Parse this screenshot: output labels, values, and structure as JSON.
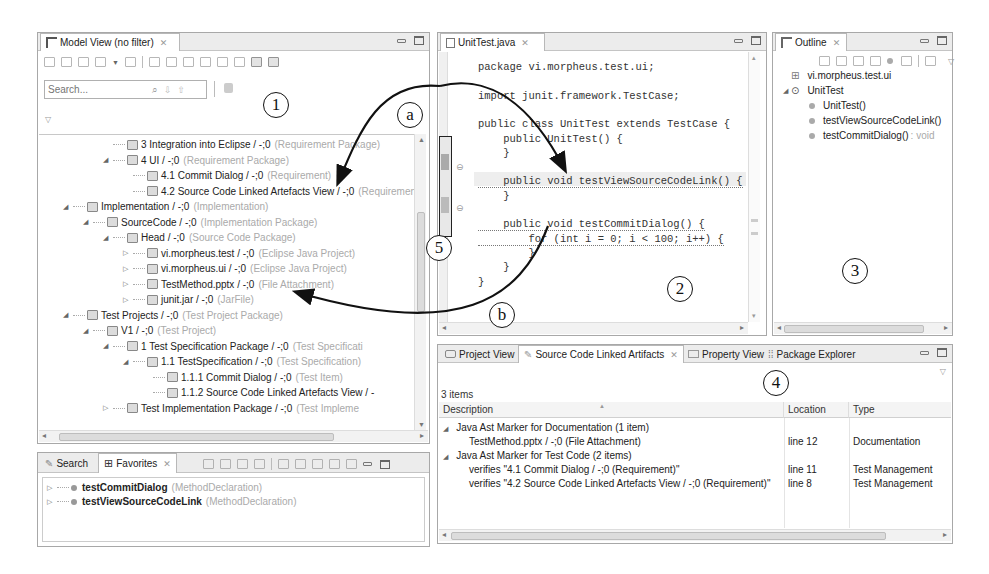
{
  "callouts": {
    "one": "1",
    "two": "2",
    "three": "3",
    "four": "4",
    "five": "5",
    "a": "a",
    "b": "b"
  },
  "model_view": {
    "tab_label": "Model View (no filter)",
    "search_placeholder": "Search...",
    "tree": [
      {
        "label": "3 Integration into Eclipse / -;0",
        "meta": "(Requirement Package)",
        "depth": 3,
        "twisty": "none"
      },
      {
        "label": "4 UI / -;0",
        "meta": "(Requirement Package)",
        "depth": 3,
        "twisty": "open"
      },
      {
        "label": "4.1 Commit Dialog / -;0",
        "meta": "(Requirement)",
        "depth": 4,
        "twisty": "none"
      },
      {
        "label": "4.2 Source Code Linked Artefacts View / -;0",
        "meta": "(Requirement)",
        "depth": 4,
        "twisty": "none"
      },
      {
        "label": "Implementation / -;0",
        "meta": "(Implementation)",
        "depth": 1,
        "twisty": "open"
      },
      {
        "label": "SourceCode / -;0",
        "meta": "(Implementation Package)",
        "depth": 2,
        "twisty": "open"
      },
      {
        "label": "Head / -;0",
        "meta": "(Source Code Package)",
        "depth": 3,
        "twisty": "open"
      },
      {
        "label": "vi.morpheus.test / -;0",
        "meta": "(Eclipse Java Project)",
        "depth": 4,
        "twisty": "closed"
      },
      {
        "label": "vi.morpheus.ui / -;0",
        "meta": "(Eclipse Java Project)",
        "depth": 4,
        "twisty": "closed"
      },
      {
        "label": "TestMethod.pptx / -;0",
        "meta": "(File Attachment)",
        "depth": 4,
        "twisty": "closed"
      },
      {
        "label": "junit.jar / -;0",
        "meta": "(JarFile)",
        "depth": 4,
        "twisty": "closed"
      },
      {
        "label": "Test Projects / -;0",
        "meta": "(Test Project Package)",
        "depth": 1,
        "twisty": "open"
      },
      {
        "label": "V1 / -;0",
        "meta": "(Test Project)",
        "depth": 2,
        "twisty": "open"
      },
      {
        "label": "1 Test Specification Package / -;0",
        "meta": "(Test Specificati",
        "depth": 3,
        "twisty": "open"
      },
      {
        "label": "1.1 TestSpecification / -;0",
        "meta": "(Test Specification)",
        "depth": 4,
        "twisty": "open"
      },
      {
        "label": "1.1.1 Commit Dialog / -;0",
        "meta": "(Test Item)",
        "depth": 5,
        "twisty": "none"
      },
      {
        "label": "1.1.2 Source Code Linked Artefacts View / -",
        "meta": "",
        "depth": 5,
        "twisty": "none"
      },
      {
        "label": "Test Implementation Package / -;0",
        "meta": "(Test Impleme",
        "depth": 3,
        "twisty": "closed"
      }
    ]
  },
  "favorites": {
    "tabs": [
      {
        "label": "Search"
      },
      {
        "label": "Favorites"
      }
    ],
    "items": [
      {
        "label": "testCommitDialog",
        "meta": "(MethodDeclaration)"
      },
      {
        "label": "testViewSourceCodeLink",
        "meta": "(MethodDeclaration)"
      }
    ]
  },
  "editor": {
    "tab_label": "UnitTest.java",
    "lines": [
      "package vi.morpheus.test.ui;",
      "",
      "import junit.framework.TestCase;",
      "",
      "public class UnitTest extends TestCase {",
      "    public UnitTest() {",
      "    }",
      "",
      "    public void testViewSourceCodeLink() {",
      "    }",
      "",
      "    public void testCommitDialog() {",
      "        for (int i = 0; i < 100; i++) {",
      "        }",
      "    }",
      "}"
    ]
  },
  "outline": {
    "tab_label": "Outline",
    "items": [
      {
        "label": "vi.morpheus.test.ui",
        "meta": "",
        "depth": 0
      },
      {
        "label": "UnitTest",
        "meta": "",
        "depth": 0
      },
      {
        "label": "UnitTest()",
        "meta": "",
        "depth": 1
      },
      {
        "label": "testViewSourceCodeLink()",
        "meta": "",
        "depth": 1
      },
      {
        "label": "testCommitDialog()",
        "meta": ": void",
        "depth": 1
      }
    ]
  },
  "linked": {
    "tabs": [
      {
        "label": "Project View"
      },
      {
        "label": "Source Code Linked Artifacts"
      },
      {
        "label": "Property View"
      },
      {
        "label": "Package Explorer"
      }
    ],
    "count": "3 items",
    "columns": [
      "Description",
      "Location",
      "Type"
    ],
    "groups": [
      {
        "label": "Java Ast Marker for Documentation (1 item)",
        "rows": [
          {
            "description": "TestMethod.pptx / -;0 (File Attachment)",
            "location": "line 12",
            "type": "Documentation"
          }
        ]
      },
      {
        "label": "Java Ast Marker for Test Code (2 items)",
        "rows": [
          {
            "description": "verifies \"4.1 Commit Dialog / -;0 (Requirement)\"",
            "location": "line 11",
            "type": "Test Management"
          },
          {
            "description": "verifies \"4.2 Source Code Linked Artefacts View / -;0 (Requirement)\"",
            "location": "line 8",
            "type": "Test Management"
          }
        ]
      }
    ]
  }
}
